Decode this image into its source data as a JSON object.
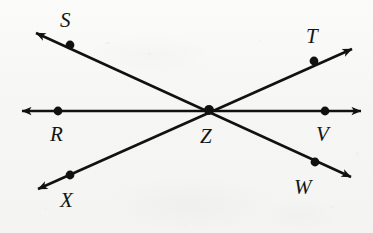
{
  "figure": {
    "type": "geometry-diagram",
    "background_color": "#f7f7f5",
    "ink_color": "#111111",
    "width": 373,
    "height": 233
  },
  "points": [
    {
      "id": "S",
      "label": "S",
      "dot_x": 70,
      "dot_y": 45,
      "label_x": 60,
      "label_y": 10
    },
    {
      "id": "T",
      "label": "T",
      "dot_x": 314,
      "dot_y": 61,
      "label_x": 306,
      "label_y": 26
    },
    {
      "id": "R",
      "label": "R",
      "dot_x": 58,
      "dot_y": 111,
      "label_x": 50,
      "label_y": 124
    },
    {
      "id": "Z",
      "label": "Z",
      "dot_x": 209,
      "dot_y": 110,
      "label_x": 200,
      "label_y": 126
    },
    {
      "id": "V",
      "label": "V",
      "dot_x": 325,
      "dot_y": 111,
      "label_x": 316,
      "label_y": 124
    },
    {
      "id": "X",
      "label": "X",
      "dot_x": 70,
      "dot_y": 175,
      "label_x": 60,
      "label_y": 190
    },
    {
      "id": "W",
      "label": "W",
      "dot_x": 315,
      "dot_y": 162,
      "label_x": 294,
      "label_y": 177
    }
  ],
  "lines": [
    {
      "id": "line-RV",
      "name": "horizontal-line-R-Z-V",
      "through": [
        "R",
        "Z",
        "V"
      ],
      "x1": 22,
      "y1": 111,
      "x2": 361,
      "y2": 111,
      "arrow_start": true,
      "arrow_end": true
    },
    {
      "id": "line-SW",
      "name": "line-S-Z-W",
      "through": [
        "S",
        "Z",
        "W"
      ],
      "x1": 36,
      "y1": 33,
      "x2": 351,
      "y2": 177,
      "arrow_start": true,
      "arrow_end": true
    },
    {
      "id": "line-XT",
      "name": "line-X-Z-T",
      "through": [
        "X",
        "Z",
        "T"
      ],
      "x1": 38,
      "y1": 189,
      "x2": 352,
      "y2": 49,
      "arrow_start": true,
      "arrow_end": true
    }
  ],
  "specks": [
    {
      "x": 105,
      "y": 42,
      "w": 5,
      "h": 2,
      "o": 0.22
    },
    {
      "x": 148,
      "y": 53,
      "w": 3,
      "h": 2,
      "o": 0.14
    },
    {
      "x": 258,
      "y": 40,
      "w": 3,
      "h": 2,
      "o": 0.12
    },
    {
      "x": 356,
      "y": 152,
      "w": 3,
      "h": 3,
      "o": 0.16
    },
    {
      "x": 330,
      "y": 206,
      "w": 4,
      "h": 2,
      "o": 0.12
    },
    {
      "x": 44,
      "y": 208,
      "w": 3,
      "h": 2,
      "o": 0.1
    },
    {
      "x": 183,
      "y": 223,
      "w": 4,
      "h": 2,
      "o": 0.1
    }
  ]
}
